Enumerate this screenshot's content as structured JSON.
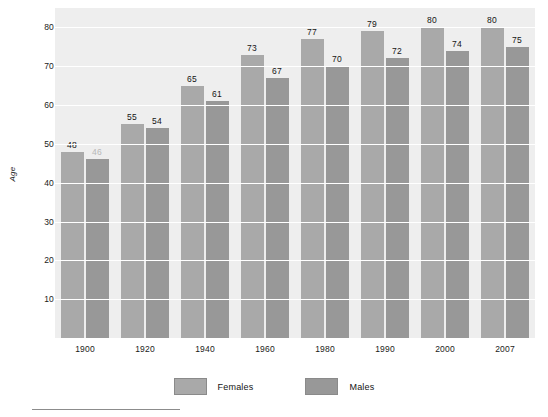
{
  "chart_data": {
    "type": "bar",
    "title": "",
    "subtitle": "",
    "xlabel": "",
    "ylabel": "Age",
    "categories": [
      "1900",
      "1920",
      "1940",
      "1960",
      "1980",
      "1990",
      "2000",
      "2007"
    ],
    "series": [
      {
        "name": "Females",
        "color": "#a9a9a9",
        "values": [
          48,
          55,
          65,
          73,
          77,
          79,
          80,
          80
        ]
      },
      {
        "name": "Males",
        "color": "#989898",
        "values": [
          46,
          54,
          61,
          67,
          70,
          72,
          74,
          75
        ]
      }
    ],
    "ylim": [
      0,
      85
    ],
    "yticks": [
      10,
      20,
      30,
      40,
      50,
      60,
      70,
      80
    ],
    "grid": true,
    "grid_color": "#ffffff",
    "plot_background": "#eeeeee",
    "legend_position": "bottom",
    "data_labels": true,
    "notes": {
      "faded_label_value": "46",
      "faded_label_series": "Males",
      "faded_label_category": "1900"
    }
  },
  "legend": {
    "items": [
      {
        "label": "Females",
        "color": "#a9a9a9"
      },
      {
        "label": "Males",
        "color": "#989898"
      }
    ]
  }
}
